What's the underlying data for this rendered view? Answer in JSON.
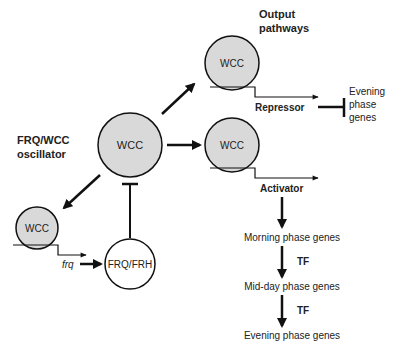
{
  "colors": {
    "wcc_fill": "#d9d9d9",
    "stroke": "#111111",
    "frq_fill": "#ffffff"
  },
  "labels": {
    "oscillator_line1": "FRQ/WCC",
    "oscillator_line2": "oscillator",
    "output_line1": "Output",
    "output_line2": "pathways",
    "repressor": "Repressor",
    "activator": "Activator",
    "evening_line1": "Evening",
    "evening_line2": "phase",
    "evening_line3": "genes",
    "frq_gene": "frq",
    "tf1": "TF",
    "tf2": "TF"
  },
  "nodes": {
    "wcc_center": "WCC",
    "wcc_repressor": "WCC",
    "wcc_activator": "WCC",
    "wcc_frq": "WCC",
    "frq_frh": "FRQ/FRH"
  },
  "cascade": [
    "Morning phase genes",
    "Mid-day phase genes",
    "Evening phase genes"
  ]
}
